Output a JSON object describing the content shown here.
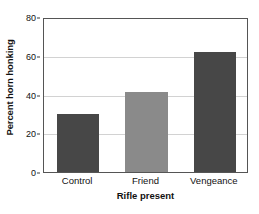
{
  "chart_data": {
    "type": "bar",
    "title": "",
    "xlabel": "Rifle present",
    "ylabel": "Percent horn honking",
    "categories": [
      "Control",
      "Friend",
      "Vengeance"
    ],
    "values": [
      30,
      41.5,
      62
    ],
    "series": [
      {
        "name": "Percent horn honking",
        "values": [
          30,
          41.5,
          62
        ]
      }
    ],
    "ylim": [
      0,
      80
    ],
    "yticks": [
      0,
      20,
      40,
      60,
      80
    ],
    "ytick_labels": [
      "0",
      "20",
      "40",
      "60",
      "80"
    ],
    "grid": true,
    "legend": false,
    "legend_position": "none",
    "bar_colors": [
      "#474747",
      "#8a8a8a",
      "#474747"
    ],
    "frame_color": "#555555",
    "gridline_color": "#d2d2d2",
    "background": "#ffffff"
  }
}
